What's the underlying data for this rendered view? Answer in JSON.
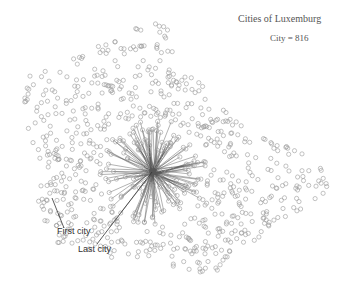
{
  "chart_data": {
    "type": "scatter",
    "title": "Cities of Luxemburg",
    "subtitle": "City = 816",
    "n_points": 816,
    "xlabel": "",
    "ylabel": "",
    "grid": false,
    "legend": null,
    "marker": {
      "shape": "hollow-circle",
      "radius": 2.1,
      "stroke": "#9a9a9a"
    },
    "edges": {
      "style": "star from last city to visited cities",
      "stroke": "#555555",
      "count": 150
    },
    "star_center": [
      153,
      172
    ],
    "outline_polygon": [
      [
        150,
        18
      ],
      [
        170,
        28
      ],
      [
        175,
        65
      ],
      [
        190,
        72
      ],
      [
        215,
        95
      ],
      [
        240,
        125
      ],
      [
        270,
        140
      ],
      [
        300,
        150
      ],
      [
        322,
        165
      ],
      [
        332,
        188
      ],
      [
        318,
        198
      ],
      [
        298,
        212
      ],
      [
        272,
        228
      ],
      [
        250,
        245
      ],
      [
        225,
        262
      ],
      [
        210,
        278
      ],
      [
        192,
        276
      ],
      [
        175,
        268
      ],
      [
        150,
        258
      ],
      [
        125,
        262
      ],
      [
        105,
        258
      ],
      [
        85,
        248
      ],
      [
        55,
        242
      ],
      [
        45,
        222
      ],
      [
        35,
        200
      ],
      [
        38,
        175
      ],
      [
        28,
        130
      ],
      [
        22,
        95
      ],
      [
        25,
        72
      ],
      [
        55,
        68
      ],
      [
        90,
        50
      ],
      [
        120,
        35
      ]
    ],
    "annotations": [
      {
        "text": "First city",
        "label_xy": [
          57,
          226
        ],
        "line_from": [
          52,
          198
        ],
        "line_to": [
          64,
          228
        ]
      },
      {
        "text": "Last city",
        "label_xy": [
          78,
          244
        ],
        "line_from": [
          97,
          244
        ],
        "line_to": [
          152,
          172
        ]
      }
    ]
  },
  "labels": {
    "title": "Cities of Luxemburg",
    "subtitle": "City = 816",
    "first_city": "First city",
    "last_city": "Last city"
  }
}
